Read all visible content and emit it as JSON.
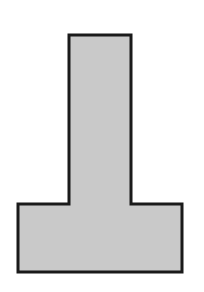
{
  "diagram": {
    "shape": "inverted-T",
    "fill_color": "#c9c9c9",
    "stroke_color": "#1a1a1a",
    "stroke_width": 3,
    "points": "69,35 131,35 131,204 182,204 182,272 18,272 18,204 69,204"
  }
}
